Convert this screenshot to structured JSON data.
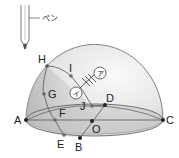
{
  "diagram": {
    "type": "hemisphere-sun-path",
    "pen": {
      "label": "ペン"
    },
    "points": {
      "A": "A",
      "B": "B",
      "C": "C",
      "D": "D",
      "E": "E",
      "F": "F",
      "G": "G",
      "H": "H",
      "I": "I",
      "J": "J",
      "O": "O"
    },
    "markers": {
      "a": "ア",
      "i": "イ"
    },
    "colors": {
      "dome_fill_light": "#f4f4f4",
      "dome_fill_dark": "#c8c8c8",
      "base_fill": "#bdbdbd",
      "line": "#555555",
      "point": "#222222",
      "point_gray": "#6a6a6a"
    }
  }
}
